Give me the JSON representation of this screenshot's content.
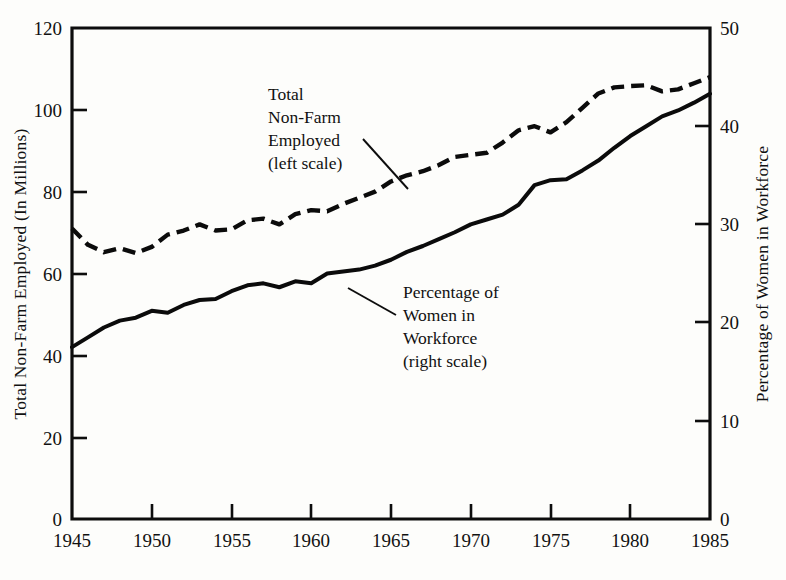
{
  "chart_data": {
    "type": "line",
    "title": "",
    "xlabel": "",
    "grid": false,
    "legend_position": "inline-annotations",
    "x": [
      1945,
      1946,
      1947,
      1948,
      1949,
      1950,
      1951,
      1952,
      1953,
      1954,
      1955,
      1956,
      1957,
      1958,
      1959,
      1960,
      1961,
      1962,
      1963,
      1964,
      1965,
      1966,
      1967,
      1968,
      1969,
      1970,
      1971,
      1972,
      1973,
      1974,
      1975,
      1976,
      1977,
      1978,
      1979,
      1980,
      1981,
      1982,
      1983,
      1984,
      1985
    ],
    "xlim": [
      1945,
      1985
    ],
    "xticks": [
      1945,
      1950,
      1955,
      1960,
      1965,
      1970,
      1975,
      1980,
      1985
    ],
    "xticklabels": [
      "1945",
      "1950",
      "1955",
      "1960",
      "1965",
      "1970",
      "1975",
      "1980",
      "1985"
    ],
    "left_axis": {
      "label": "Total Non-Farm Employed (In Millions)",
      "ylim": [
        0,
        120
      ],
      "yticks": [
        0,
        20,
        40,
        60,
        80,
        100,
        120
      ],
      "yticklabels": [
        "0",
        "20",
        "40",
        "60",
        "80",
        "100",
        "120"
      ]
    },
    "right_axis": {
      "label": "Percentage of Women in Workforce",
      "ylim": [
        0,
        50
      ],
      "yticks": [
        0,
        10,
        20,
        30,
        40,
        50
      ],
      "yticklabels": [
        "0",
        "10",
        "20",
        "30",
        "40",
        "50"
      ]
    },
    "series": [
      {
        "name": "Total Non-Farm Employed",
        "axis": "left",
        "style": "dashed",
        "unit": "millions",
        "values": [
          71.0,
          67.0,
          65.2,
          66.2,
          65.0,
          66.5,
          69.5,
          70.5,
          72.0,
          70.5,
          70.8,
          73.0,
          73.4,
          72.0,
          74.5,
          75.5,
          75.2,
          77.0,
          78.5,
          80.0,
          82.5,
          84.0,
          85.0,
          86.5,
          88.5,
          89.0,
          89.5,
          92.0,
          95.0,
          96.0,
          94.5,
          97.0,
          100.5,
          104.0,
          105.5,
          105.8,
          106.0,
          104.5,
          105.0,
          106.5,
          108.0
        ]
      },
      {
        "name": "Percentage of Women in Workforce",
        "axis": "right",
        "style": "solid",
        "unit": "percent",
        "values": [
          17.5,
          18.5,
          19.5,
          20.2,
          20.5,
          21.2,
          21.0,
          21.8,
          22.3,
          22.4,
          23.2,
          23.8,
          24.0,
          23.6,
          24.2,
          24.0,
          25.0,
          25.2,
          25.4,
          25.8,
          26.4,
          27.2,
          27.8,
          28.5,
          29.2,
          30.0,
          30.5,
          31.0,
          32.0,
          34.0,
          34.5,
          34.6,
          35.5,
          36.5,
          37.8,
          39.0,
          40.0,
          41.0,
          41.6,
          42.4,
          43.3
        ]
      }
    ],
    "annotations": [
      {
        "id": "annotation-total-nonfarm",
        "lines": [
          "Total",
          "Non-Farm",
          "Employed",
          "(left scale)"
        ],
        "target_series": "Total Non-Farm Employed"
      },
      {
        "id": "annotation-percentage-women",
        "lines": [
          "Percentage of",
          "Women in",
          "Workforce",
          "(right scale)"
        ],
        "target_series": "Percentage of Women in Workforce"
      }
    ]
  },
  "colors": {
    "ink": "#0b0b0b",
    "paper": "#fdfdfb"
  }
}
